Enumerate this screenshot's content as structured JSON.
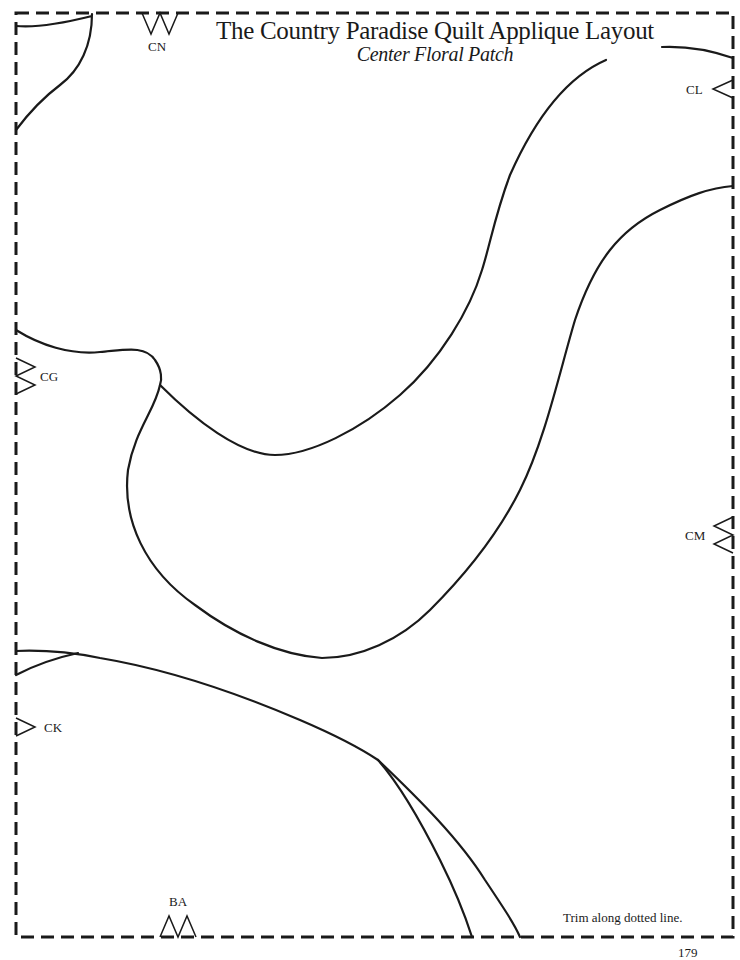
{
  "header": {
    "title": "The Country Paradise Quilt Applique Layout",
    "subtitle": "Center Floral Patch"
  },
  "markers": {
    "cn": "CN",
    "cl": "CL",
    "cg": "CG",
    "cm": "CM",
    "ck": "CK",
    "ba": "BA"
  },
  "footer": {
    "instruction": "Trim along dotted line.",
    "page_number": "179"
  },
  "colors": {
    "ink": "#1a1a1a",
    "paper": "#ffffff"
  }
}
